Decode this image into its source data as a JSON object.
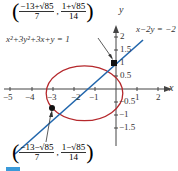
{
  "diagram": {
    "equations": {
      "ellipse": "x²+3y²+3x+y = 1",
      "line": "x−2y = −2"
    },
    "axes": {
      "x_label": "x",
      "y_label": "y",
      "x_ticks": [
        "−5",
        "−4",
        "−3",
        "−2",
        "−1",
        "1",
        "2"
      ],
      "y_ticks": [
        "2",
        "1.5",
        "1",
        "0.5",
        "−0.5",
        "−1",
        "−1.5"
      ]
    },
    "points": [
      {
        "x_num": "−13+√85",
        "x_den": "7",
        "y_num": "1+√85",
        "y_den": "14"
      },
      {
        "x_num": "−13−√85",
        "x_den": "7",
        "y_num": "1−√85",
        "y_den": "14"
      }
    ],
    "colors": {
      "ellipse": "#b5282c",
      "line": "#2166ac",
      "axis": "#444444"
    }
  }
}
